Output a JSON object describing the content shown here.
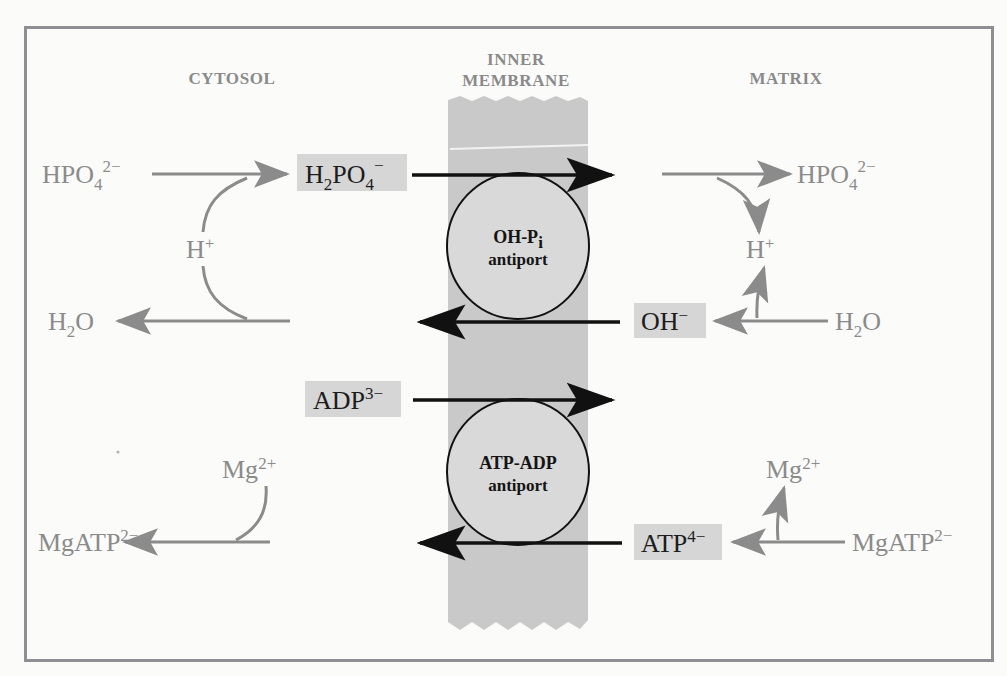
{
  "figure": {
    "border_color": "#8f8f93",
    "background_color": "#fbfbfa",
    "membrane_color": "#c9c9c9",
    "highlight_box_color": "#d6d6d6",
    "gray_arrow_color": "#8b8b8b",
    "black_arrow_color": "#111111",
    "carrier_fill_color": "#d9d9d9"
  },
  "headers": {
    "left": "CYTOSOL",
    "center_line1": "INNER",
    "center_line2": "MEMBRANE",
    "right": "MATRIX"
  },
  "carriers": [
    {
      "id": "oh-pi",
      "line1_main": "OH-P",
      "line1_sub": "i",
      "line2": "antiport",
      "cx": 518,
      "cy": 246,
      "rx": 71,
      "ry": 73
    },
    {
      "id": "atp-adp",
      "line1_main": "ATP-ADP",
      "line1_sub": "",
      "line2": "antiport",
      "cx": 518,
      "cy": 472,
      "rx": 71,
      "ry": 73
    }
  ],
  "species": {
    "cytosol_hpo4": {
      "base": "HPO",
      "sub": "4",
      "sup": "2−"
    },
    "cytosol_h2po4_box": {
      "base_h": "H",
      "base_sub1": "2",
      "base_po": "PO",
      "base_sub2": "4",
      "sup": "−"
    },
    "cytosol_h_plus": {
      "base": "H",
      "sup": "+"
    },
    "cytosol_h2o": {
      "base_h": "H",
      "sub": "2",
      "base_o": "O"
    },
    "cytosol_adp_box": {
      "base": "ADP",
      "sup": "3−"
    },
    "cytosol_mg": {
      "base": "Mg",
      "sup": "2+"
    },
    "cytosol_mgatp": {
      "base": "MgATP",
      "sup": "2−"
    },
    "matrix_hpo4": {
      "base": "HPO",
      "sub": "4",
      "sup": "2−"
    },
    "matrix_h_plus": {
      "base": "H",
      "sup": "+"
    },
    "matrix_h2o": {
      "base_h": "H",
      "sub": "2",
      "base_o": "O"
    },
    "matrix_oh_box": {
      "base": "OH",
      "sup": "−"
    },
    "matrix_atp_box": {
      "base": "ATP",
      "sup": "4−"
    },
    "matrix_mg": {
      "base": "Mg",
      "sup": "2+"
    },
    "matrix_mgatp": {
      "base": "MgATP",
      "sup": "2−"
    }
  },
  "transport_events": [
    {
      "name": "phosphate-in",
      "label": "H2PO4- into matrix",
      "direction": "left-to-right",
      "y": 175
    },
    {
      "name": "hydroxide-out",
      "label": "OH- out of matrix",
      "direction": "right-to-left",
      "y": 322
    },
    {
      "name": "adp-in",
      "label": "ADP3- into matrix",
      "direction": "left-to-right",
      "y": 400
    },
    {
      "name": "atp-out",
      "label": "ATP4- out of matrix",
      "direction": "right-to-left",
      "y": 543
    }
  ]
}
